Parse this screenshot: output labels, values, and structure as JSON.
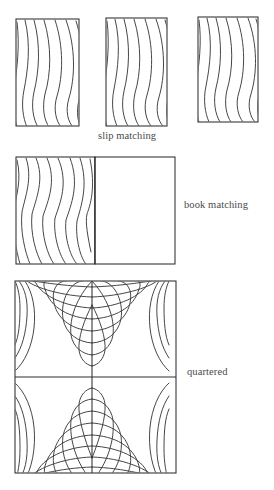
{
  "figure": {
    "background_color": "#ffffff",
    "line_color": "#3c3c3c",
    "frame_color": "#2e2e2e",
    "width": 274,
    "height": 490
  },
  "captions": {
    "slip": "slip matching",
    "book": "book  matching",
    "quartered": "quartered"
  },
  "sections": [
    {
      "id": "slip-matching",
      "label": "slip matching",
      "panel_count": 3,
      "description": "Three identical veneer leaves slid side by side, grain repeats without mirroring",
      "panels": [
        {
          "x": 16,
          "y": 19,
          "width": 63,
          "height": 107,
          "mirrored": false
        },
        {
          "x": 106,
          "y": 18,
          "width": 61,
          "height": 108,
          "mirrored": false
        },
        {
          "x": 198,
          "y": 17,
          "width": 60,
          "height": 105,
          "mirrored": false
        }
      ]
    },
    {
      "id": "book-matching",
      "label": "book  matching",
      "panel_count": 2,
      "description": "Two veneer leaves opened like a book, mirrored about the center seam",
      "panels": [
        {
          "x": 16,
          "y": 157,
          "width": 79,
          "height": 107,
          "mirrored": false
        },
        {
          "x": 95,
          "y": 157,
          "width": 80,
          "height": 107,
          "mirrored": true
        }
      ],
      "seam_x": 95
    },
    {
      "id": "quartered",
      "label": "quartered",
      "panel_count": 4,
      "description": "Four leaves mirrored about both axes forming concentric diamond rings around the center",
      "bounds": {
        "x": 15,
        "y": 281,
        "width": 161,
        "height": 192
      },
      "center": {
        "x": 92,
        "y": 377
      },
      "ring_count": 9
    }
  ]
}
